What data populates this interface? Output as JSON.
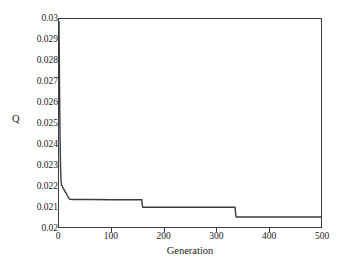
{
  "chart_data": {
    "type": "line",
    "title": "",
    "xlabel": "Generation",
    "ylabel": "Q",
    "xlim": [
      0,
      500
    ],
    "ylim": [
      0.02,
      0.03
    ],
    "grid": false,
    "legend": null,
    "xticks": [
      0,
      100,
      200,
      300,
      400,
      500
    ],
    "xtick_labels": [
      "0",
      "100",
      "200",
      "300",
      "400",
      "500"
    ],
    "yticks": [
      0.02,
      0.021,
      0.022,
      0.023,
      0.024,
      0.025,
      0.026,
      0.027,
      0.028,
      0.029,
      0.03
    ],
    "ytick_labels": [
      "0.02",
      "0.021",
      "0.022",
      "0.023",
      "0.024",
      "0.025",
      "0.026",
      "0.027",
      "0.028",
      "0.029",
      "0.03"
    ],
    "series": [
      {
        "name": "Q",
        "color": "#3a3a3a",
        "line_width": 1.4,
        "x": [
          0,
          1,
          2,
          3,
          4,
          5,
          6,
          8,
          10,
          12,
          14,
          16,
          18,
          20,
          22,
          25,
          60,
          100,
          140,
          158,
          159,
          160,
          200,
          250,
          300,
          330,
          336,
          337,
          338,
          380,
          420,
          460,
          500
        ],
        "y": [
          0.0299,
          0.0268,
          0.0243,
          0.0228,
          0.0222,
          0.022,
          0.02198,
          0.02185,
          0.02178,
          0.02168,
          0.02162,
          0.0215,
          0.02142,
          0.02134,
          0.02133,
          0.02132,
          0.02132,
          0.02131,
          0.02131,
          0.02131,
          0.02105,
          0.02095,
          0.02095,
          0.02095,
          0.02095,
          0.02095,
          0.02095,
          0.02065,
          0.02048,
          0.02048,
          0.02048,
          0.02048,
          0.02048
        ]
      }
    ],
    "annotations": []
  },
  "style": {
    "axis_color": "#3d3d3d",
    "background": "#ffffff",
    "text_color": "#1a1a1a"
  }
}
